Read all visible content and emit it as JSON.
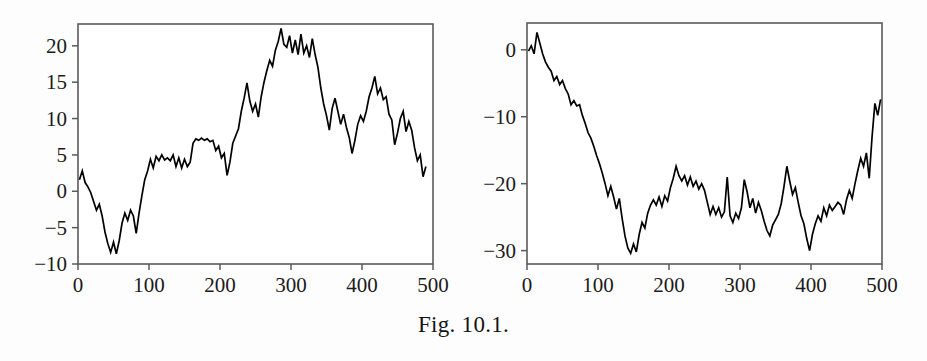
{
  "figure": {
    "caption": "Fig. 10.1.",
    "panel_count": 2
  },
  "chart_data": [
    {
      "type": "line",
      "panel": "left",
      "title": "",
      "xlabel": "",
      "ylabel": "",
      "xlim": [
        0,
        500
      ],
      "ylim": [
        -10,
        23
      ],
      "grid": false,
      "legend": false,
      "xticks": [
        0,
        100,
        200,
        300,
        400,
        500
      ],
      "xticklabels": [
        "0",
        "100",
        "200",
        "300",
        "400",
        "500"
      ],
      "yticks": [
        -10,
        -5,
        0,
        5,
        10,
        15,
        20
      ],
      "yticklabels": [
        "-10",
        "-5",
        "0",
        "5",
        "10",
        "15",
        "20"
      ],
      "series": [
        {
          "name": "random walk 1",
          "color": "#000000",
          "x": [
            2,
            6,
            10,
            14,
            18,
            22,
            26,
            30,
            34,
            38,
            42,
            46,
            50,
            54,
            58,
            62,
            66,
            70,
            74,
            78,
            82,
            86,
            90,
            94,
            98,
            102,
            106,
            110,
            114,
            118,
            122,
            126,
            130,
            134,
            138,
            142,
            146,
            150,
            154,
            158,
            162,
            166,
            170,
            174,
            178,
            182,
            186,
            190,
            194,
            198,
            202,
            206,
            210,
            214,
            218,
            222,
            226,
            230,
            234,
            238,
            242,
            246,
            250,
            254,
            258,
            262,
            266,
            270,
            274,
            278,
            282,
            286,
            290,
            294,
            298,
            302,
            306,
            310,
            314,
            318,
            322,
            326,
            330,
            334,
            338,
            342,
            346,
            350,
            354,
            358,
            362,
            366,
            370,
            374,
            378,
            382,
            386,
            390,
            394,
            398,
            402,
            406,
            410,
            414,
            418,
            422,
            426,
            430,
            434,
            438,
            442,
            446,
            450,
            454,
            458,
            462,
            466,
            470,
            474,
            478,
            482,
            486,
            490,
            494,
            498
          ],
          "y": [
            1.6,
            2.8,
            1.2,
            0.6,
            -0.2,
            -1.4,
            -2.6,
            -1.8,
            -3.4,
            -5.6,
            -7.2,
            -8.4,
            -7.0,
            -8.6,
            -6.8,
            -4.4,
            -3.0,
            -4.0,
            -2.6,
            -3.4,
            -5.8,
            -3.0,
            -0.6,
            1.6,
            2.8,
            4.4,
            3.2,
            4.8,
            4.2,
            5.0,
            4.3,
            4.6,
            4.2,
            5.0,
            3.4,
            4.6,
            3.2,
            4.4,
            3.4,
            4.0,
            6.6,
            7.2,
            7.0,
            7.3,
            7.0,
            7.2,
            6.8,
            7.0,
            5.6,
            6.2,
            4.6,
            5.2,
            2.2,
            4.0,
            6.6,
            7.6,
            8.6,
            11.0,
            12.8,
            14.9,
            12.4,
            11.0,
            12.0,
            10.2,
            13.0,
            15.0,
            16.6,
            18.0,
            17.2,
            19.4,
            20.6,
            22.4,
            20.2,
            19.8,
            21.4,
            19.0,
            20.8,
            18.8,
            21.6,
            19.0,
            20.0,
            18.4,
            21.0,
            18.8,
            17.0,
            14.2,
            12.0,
            10.4,
            8.4,
            11.4,
            12.8,
            11.0,
            9.2,
            10.6,
            8.8,
            7.4,
            5.2,
            7.0,
            9.2,
            10.4,
            9.6,
            11.0,
            13.0,
            14.2,
            15.8,
            13.4,
            14.2,
            12.6,
            13.0,
            10.6,
            9.8,
            6.4,
            8.0,
            10.0,
            11.0,
            8.2,
            9.6,
            8.4,
            6.0,
            4.2,
            5.0,
            2.0,
            3.4
          ]
        }
      ]
    },
    {
      "type": "line",
      "panel": "right",
      "title": "",
      "xlabel": "",
      "ylabel": "",
      "xlim": [
        0,
        500
      ],
      "ylim": [
        -32,
        4
      ],
      "grid": false,
      "legend": false,
      "xticks": [
        0,
        100,
        200,
        300,
        400,
        500
      ],
      "xticklabels": [
        "0",
        "100",
        "200",
        "300",
        "400",
        "500"
      ],
      "yticks": [
        -30,
        -20,
        -10,
        0
      ],
      "yticklabels": [
        "-30",
        "-20",
        "-10",
        "0"
      ],
      "series": [
        {
          "name": "random walk 2",
          "color": "#000000",
          "x": [
            2,
            6,
            10,
            14,
            18,
            22,
            26,
            30,
            34,
            38,
            42,
            46,
            50,
            54,
            58,
            62,
            66,
            70,
            74,
            78,
            82,
            86,
            90,
            94,
            98,
            102,
            106,
            110,
            114,
            118,
            122,
            126,
            130,
            134,
            138,
            142,
            146,
            150,
            154,
            158,
            162,
            166,
            170,
            174,
            178,
            182,
            186,
            190,
            194,
            198,
            202,
            206,
            210,
            214,
            218,
            222,
            226,
            230,
            234,
            238,
            242,
            246,
            250,
            254,
            258,
            262,
            266,
            270,
            274,
            278,
            282,
            286,
            290,
            294,
            298,
            302,
            306,
            310,
            314,
            318,
            322,
            326,
            330,
            334,
            338,
            342,
            346,
            350,
            354,
            358,
            362,
            366,
            370,
            374,
            378,
            382,
            386,
            390,
            394,
            398,
            402,
            406,
            410,
            414,
            418,
            422,
            426,
            430,
            434,
            438,
            442,
            446,
            450,
            454,
            458,
            462,
            466,
            470,
            474,
            478,
            482,
            486,
            490,
            494,
            498
          ],
          "y": [
            -0.2,
            0.6,
            -0.6,
            2.6,
            1.0,
            -0.6,
            -1.8,
            -2.6,
            -3.2,
            -4.6,
            -4.0,
            -5.2,
            -4.6,
            -5.8,
            -6.6,
            -8.2,
            -7.6,
            -8.4,
            -8.2,
            -9.8,
            -11.0,
            -12.4,
            -13.2,
            -14.4,
            -15.8,
            -17.0,
            -18.4,
            -20.0,
            -21.8,
            -20.4,
            -22.0,
            -23.8,
            -22.2,
            -25.2,
            -27.8,
            -29.6,
            -30.4,
            -29.0,
            -30.2,
            -27.6,
            -25.8,
            -26.6,
            -24.4,
            -23.2,
            -22.4,
            -23.2,
            -22.0,
            -23.4,
            -21.8,
            -22.6,
            -20.6,
            -19.2,
            -17.4,
            -18.8,
            -19.6,
            -18.8,
            -20.2,
            -19.0,
            -20.4,
            -19.6,
            -20.8,
            -20.0,
            -21.0,
            -22.8,
            -24.6,
            -23.4,
            -24.6,
            -23.6,
            -25.0,
            -24.2,
            -19.0,
            -24.8,
            -25.8,
            -24.4,
            -25.2,
            -23.6,
            -19.4,
            -21.2,
            -23.6,
            -22.2,
            -24.4,
            -22.8,
            -24.0,
            -25.6,
            -27.0,
            -27.8,
            -26.2,
            -25.4,
            -24.6,
            -23.0,
            -20.4,
            -17.4,
            -19.6,
            -21.6,
            -20.6,
            -22.8,
            -24.8,
            -26.0,
            -28.2,
            -30.0,
            -27.6,
            -26.0,
            -24.8,
            -25.6,
            -23.6,
            -24.8,
            -23.2,
            -24.0,
            -23.4,
            -22.8,
            -23.2,
            -24.6,
            -22.4,
            -21.0,
            -22.2,
            -20.0,
            -18.0,
            -16.2,
            -17.4,
            -15.4,
            -19.2,
            -13.0,
            -8.0,
            -9.8,
            -7.4,
            -6.4,
            -10.6,
            -9.0
          ]
        }
      ]
    }
  ]
}
